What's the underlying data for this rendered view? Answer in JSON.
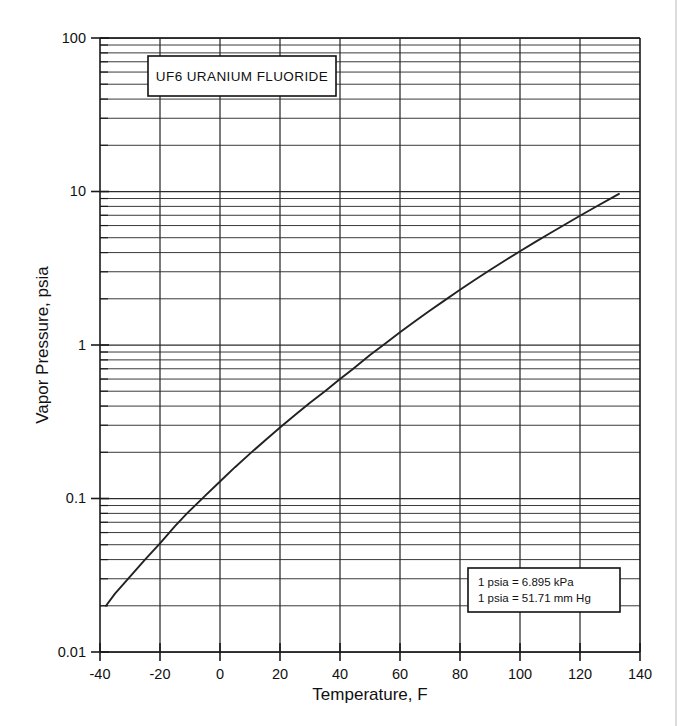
{
  "figure": {
    "title_box": {
      "label": "UF6  URANIUM FLUORIDE"
    },
    "note_box": {
      "line1": "1 psia = 6.895 kPa",
      "line2": "1 psia = 51.71 mm Hg"
    }
  },
  "chart_data": {
    "type": "line",
    "title": "UF6  URANIUM FLUORIDE",
    "xlabel": "Temperature, F",
    "ylabel": "Vapor Pressure, psia",
    "xlim": [
      -40,
      140
    ],
    "ylim": [
      0.01,
      100
    ],
    "yscale": "log",
    "xscale": "linear",
    "grid": true,
    "legend": "none",
    "xticks": [
      -40,
      -20,
      0,
      20,
      40,
      60,
      80,
      100,
      120,
      140
    ],
    "xtick_labels": [
      "-40",
      "-20",
      "0",
      "20",
      "40",
      "60",
      "80",
      "100",
      "120",
      "140"
    ],
    "yticks": [
      0.01,
      0.1,
      1,
      10,
      100
    ],
    "ytick_labels": [
      "0.01",
      "0.1",
      "1",
      "10",
      "100"
    ],
    "series": [
      {
        "name": "UF6 vapor pressure",
        "x": [
          -38,
          -35,
          -30,
          -25,
          -20,
          -15,
          -11,
          -5,
          0,
          5,
          10,
          15,
          20,
          25,
          30,
          35,
          40,
          44,
          50,
          55,
          60,
          65,
          70,
          75,
          80,
          85,
          90,
          95,
          100,
          105,
          110,
          115,
          120,
          125,
          130,
          133
        ],
        "y": [
          0.02,
          0.024,
          0.031,
          0.04,
          0.051,
          0.066,
          0.08,
          0.104,
          0.129,
          0.16,
          0.196,
          0.239,
          0.29,
          0.35,
          0.42,
          0.5,
          0.6,
          0.69,
          0.86,
          1.02,
          1.21,
          1.43,
          1.68,
          1.96,
          2.29,
          2.66,
          3.08,
          3.55,
          4.08,
          4.68,
          5.35,
          6.1,
          6.95,
          7.9,
          8.95,
          9.65
        ]
      }
    ],
    "annotations": [
      {
        "text": "UF6  URANIUM FLUORIDE",
        "position": "top-left-inside"
      },
      {
        "text": "1 psia = 6.895 kPa",
        "position": "bottom-right-inside"
      },
      {
        "text": "1 psia = 51.71 mm Hg",
        "position": "bottom-right-inside"
      }
    ]
  }
}
